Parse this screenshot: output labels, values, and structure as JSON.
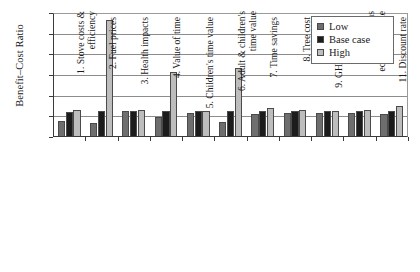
{
  "chart_data": {
    "type": "bar",
    "title": "",
    "xlabel": "",
    "ylabel": "Benefit–Cost Ratio",
    "ylim": [
      0,
      30
    ],
    "ytick_labels": [
      "0",
      "5",
      "10",
      "15",
      "20",
      "25",
      "30"
    ],
    "ytick_values": [
      0,
      5,
      10,
      15,
      20,
      25,
      30
    ],
    "grid": true,
    "legend_position": "top-right",
    "categories": [
      "1. Stove costs & efficiency",
      "2. Fuel prices",
      "3. Health impacts",
      "4. Value of time",
      "5. Children's time value",
      "6. Adult & children's time value",
      "7. Time savings",
      "8. Tree cost",
      "9. GHG emissions",
      "10. Emissions economic value",
      "11. Discount rate"
    ],
    "category_lines": [
      [
        "1. Stove costs &",
        "efficiency"
      ],
      [
        "2. Fuel prices"
      ],
      [
        "3. Health impacts"
      ],
      [
        "4. Value of time"
      ],
      [
        "5. Children's time value"
      ],
      [
        "6. Adult & children's",
        "time value"
      ],
      [
        "7. Time savings"
      ],
      [
        "8. Tree cost"
      ],
      [
        "9. GHG emissions"
      ],
      [
        "10. Emissions",
        "economic value"
      ],
      [
        "11. Discount rate"
      ]
    ],
    "series": [
      {
        "name": "Low",
        "color": "#6e6e6e",
        "values": [
          3.8,
          3.5,
          6.2,
          4.9,
          5.9,
          3.6,
          5.6,
          5.8,
          5.9,
          5.8,
          5.6
        ]
      },
      {
        "name": "Base case",
        "color": "#1c1c1c",
        "values": [
          6.1,
          6.2,
          6.2,
          6.2,
          6.2,
          6.4,
          6.2,
          6.2,
          6.2,
          6.2,
          6.2
        ]
      },
      {
        "name": "High",
        "color": "#bdbdbd",
        "values": [
          6.5,
          28.3,
          6.5,
          15.8,
          6.4,
          16.6,
          6.9,
          6.5,
          6.3,
          6.6,
          7.5
        ]
      }
    ]
  },
  "legend": {
    "items": [
      {
        "label": "Low",
        "key": "low"
      },
      {
        "label": "Base case",
        "key": "base"
      },
      {
        "label": "High",
        "key": "high"
      }
    ]
  }
}
